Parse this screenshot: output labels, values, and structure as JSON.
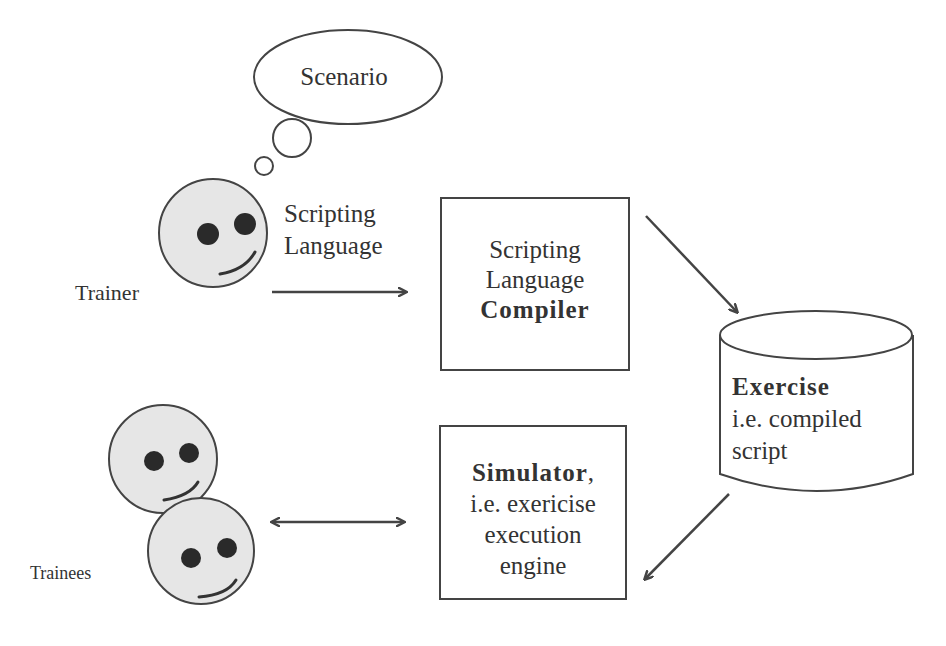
{
  "diagram": {
    "thought_bubble": {
      "label": "Scenario"
    },
    "trainer": {
      "label": "Trainer",
      "output_label_line1": "Scripting",
      "output_label_line2": "Language"
    },
    "compiler": {
      "line1": "Scripting",
      "line2": "Language",
      "line3": "Compiler"
    },
    "exercise": {
      "title": "Exercise",
      "line2": "i.e. compiled",
      "line3": "script"
    },
    "simulator": {
      "title": "Simulator",
      "title_suffix": ",",
      "line2": "i.e. exericise",
      "line3": "execution",
      "line4": "engine"
    },
    "trainees": {
      "label": "Trainees"
    },
    "colors": {
      "stroke": "#444444",
      "face_fill": "#e6e6e6",
      "eye": "#2a2a2a",
      "text": "#333333",
      "background": "#ffffff"
    }
  }
}
